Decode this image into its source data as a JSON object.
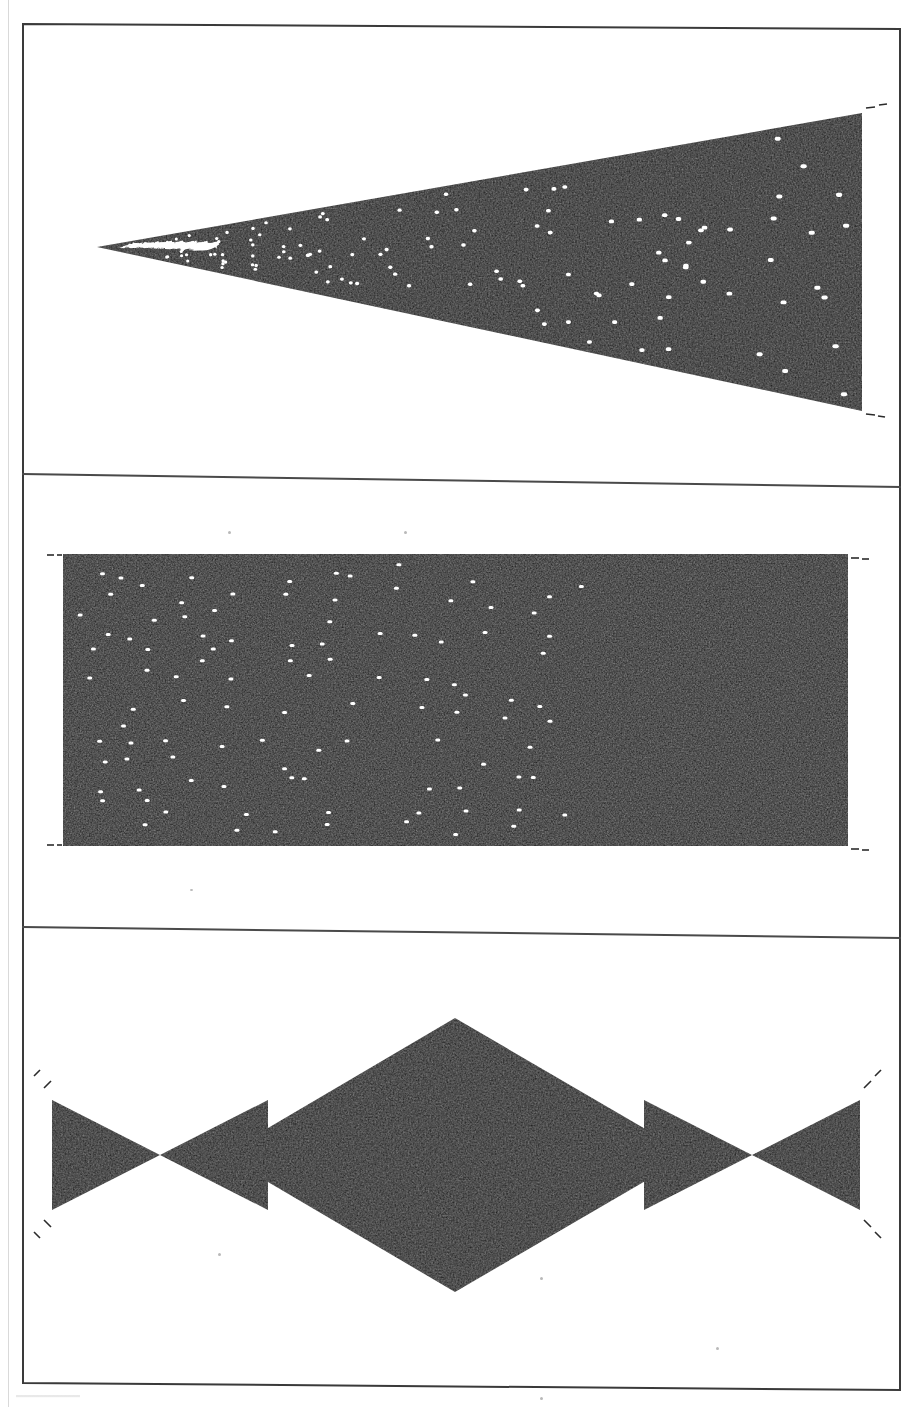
{
  "document": {
    "kind": "scanned-figure-page",
    "page_width": 910,
    "page_height": 1407,
    "background_color": "#ffffff",
    "ink_color": "#151515",
    "frame": {
      "stroke_color": "#3a3a3a",
      "stroke_width": 2,
      "skew_note": "frame is slightly rotated clockwise as typical of a flatbed scan",
      "left": 23,
      "right": 900,
      "top_left_y": 24,
      "top_right_y": 29,
      "bottom_left_y": 1383,
      "bottom_right_y": 1390
    },
    "dividers": [
      {
        "name": "divider-upper",
        "x1": 23,
        "y1": 474,
        "x2": 900,
        "y2": 487
      },
      {
        "name": "divider-lower",
        "x1": 23,
        "y1": 927,
        "x2": 900,
        "y2": 938
      }
    ],
    "caption_stub_note": "a cropped line of caption text is just visible below the frame at lower-left"
  },
  "figure": {
    "title": "",
    "panel_count": 3,
    "shared": {
      "fill_color": "#151515",
      "dot_color": "#ffffff",
      "dot_shape": "short horizontal dash",
      "dot_width": 5,
      "dot_height": 3,
      "tick_marks": "short dashed registration ticks sit just outside each shape's corners"
    },
    "panels": [
      {
        "id": "panel-top",
        "name": "wedge-panel",
        "shape": "triangular wedge",
        "description": "A solid black wedge whose apex points left; white dots grow denser and merge into zigzag streaks near the apex.",
        "apex": {
          "x": 97,
          "y": 247
        },
        "top_right": {
          "x": 862,
          "y": 113
        },
        "bottom_right": {
          "x": 862,
          "y": 411
        },
        "dot_count": 118,
        "density_gradient": "increases toward apex"
      },
      {
        "id": "panel-middle",
        "name": "uniform-rectangle-panel",
        "shape": "rectangle",
        "description": "A solid black rectangle with white dots scattered at roughly uniform density.",
        "left": 63,
        "top": 554,
        "right": 848,
        "bottom": 846,
        "dot_count": 104,
        "density_gradient": "uniform"
      },
      {
        "id": "panel-bottom",
        "name": "diamond-and-wedges-panel",
        "shape": "central diamond flanked by two pairs of opposed wedges",
        "description": "A large black rhombus centred in the panel; on each side a pair of wedges meet tip-to-tip, with white zigzag streaks radiating from the meeting points.",
        "diamond": {
          "top": {
            "x": 455,
            "y": 1018
          },
          "right": {
            "x": 690,
            "y": 1155
          },
          "bottom": {
            "x": 455,
            "y": 1292
          },
          "left": {
            "x": 222,
            "y": 1155
          }
        },
        "left_outer_wedge": {
          "outer_top": {
            "x": 52,
            "y": 1100
          },
          "outer_bottom": {
            "x": 52,
            "y": 1210
          },
          "tip": {
            "x": 160,
            "y": 1155
          }
        },
        "left_inner_wedge": {
          "tip": {
            "x": 160,
            "y": 1155
          },
          "base_top": {
            "x": 268,
            "y": 1100
          },
          "base_bottom": {
            "x": 268,
            "y": 1210
          }
        },
        "right_inner_wedge": {
          "base_top": {
            "x": 644,
            "y": 1100
          },
          "base_bottom": {
            "x": 644,
            "y": 1210
          },
          "tip": {
            "x": 752,
            "y": 1155
          }
        },
        "right_outer_wedge": {
          "tip": {
            "x": 752,
            "y": 1155
          },
          "outer_top": {
            "x": 860,
            "y": 1100
          },
          "outer_bottom": {
            "x": 860,
            "y": 1210
          }
        },
        "dot_count": 196,
        "density_gradient": "increases toward each wedge tip"
      }
    ]
  },
  "chart_data": {
    "type": "scatter",
    "title": "",
    "subtitle": "",
    "xlabel": "",
    "ylabel": "",
    "grid": false,
    "legend": "none",
    "background": "#151515",
    "marker_color": "#ffffff",
    "panels": [
      {
        "name": "panel-top",
        "region": "triangular wedge, apex at left",
        "x_range": [
          97,
          862
        ],
        "y_range": [
          113,
          411
        ],
        "point_density_model": "inverse with distance from apex — points per unit area rises sharply toward x=97",
        "approx_point_count": 118
      },
      {
        "name": "panel-middle",
        "region": "rectangle",
        "x_range": [
          63,
          848
        ],
        "y_range": [
          554,
          846
        ],
        "point_density_model": "uniform random",
        "approx_point_count": 104
      },
      {
        "name": "panel-bottom",
        "region": "rhombus plus four flanking wedges",
        "x_range": [
          52,
          860
        ],
        "y_range": [
          1018,
          1292
        ],
        "point_density_model": "uniform inside the rhombus; rising toward the two wedge convergence points at x=160 and x=752",
        "approx_point_count": 196
      }
    ]
  }
}
